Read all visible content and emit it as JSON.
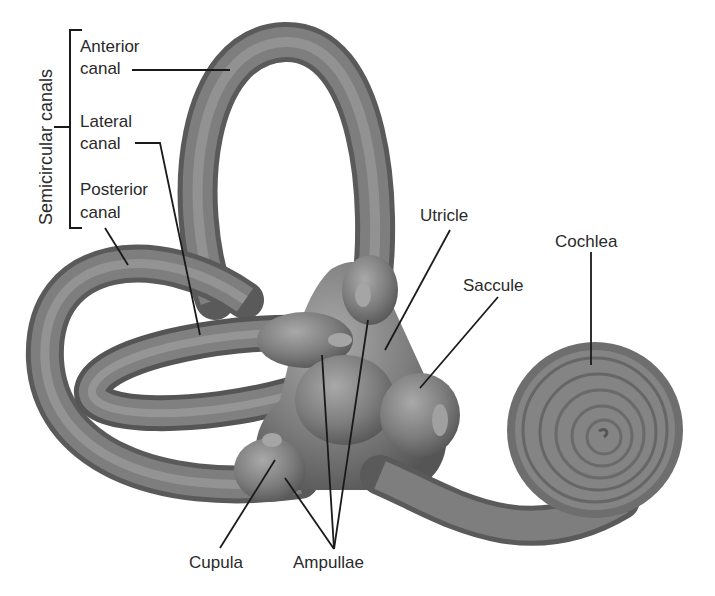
{
  "diagram": {
    "group_label": "Semicircular canals",
    "labels": {
      "anterior_1": "Anterior",
      "anterior_2": "canal",
      "lateral_1": "Lateral",
      "lateral_2": "canal",
      "posterior_1": "Posterior",
      "posterior_2": "canal",
      "utricle": "Utricle",
      "saccule": "Saccule",
      "cochlea": "Cochlea",
      "cupula": "Cupula",
      "ampullae": "Ampullae"
    },
    "colors": {
      "background": "#ffffff",
      "structure_fill": "#7a7a7a",
      "structure_highlight": "#a8a8a8",
      "structure_shadow": "#4e4e4e",
      "leader_line": "#1a1a1a",
      "text": "#2a2a2a"
    }
  }
}
